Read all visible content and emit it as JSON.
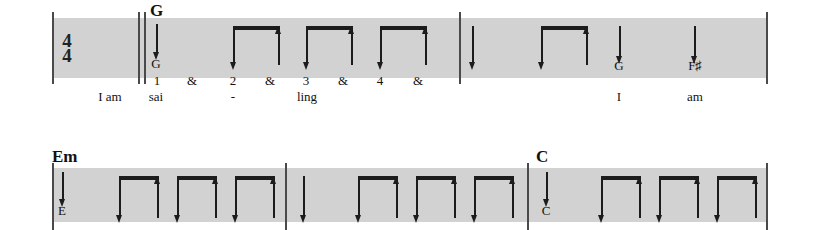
{
  "document": {
    "type": "guitar-strumming-notation",
    "time_signature": {
      "numerator": "4",
      "denominator": "4"
    }
  },
  "colors": {
    "staff_band": "#d2d2d2",
    "ink": "#1c1c1c",
    "barline": "#4a4a4a",
    "page": "#ffffff"
  },
  "systems": [
    {
      "name": "system-1",
      "measures": [
        {
          "name": "measure-1",
          "chord": "G",
          "counts": [
            "1",
            "&",
            "2",
            "&",
            "3",
            "&",
            "4",
            "&"
          ],
          "lyrics": [
            "sai",
            "-",
            "ling"
          ],
          "bass_notes": [
            "G"
          ],
          "strums": [
            "down",
            "down-up",
            "down-up",
            "down-up"
          ]
        },
        {
          "name": "measure-2",
          "chord": "",
          "counts": [],
          "lyrics": [
            "I",
            "am"
          ],
          "bass_notes": [
            "G",
            "F♯"
          ],
          "strums": [
            "down",
            "down-up",
            "down",
            "down"
          ]
        }
      ],
      "pickup_lyric": "I am"
    },
    {
      "name": "system-2",
      "measures": [
        {
          "name": "measure-3",
          "chord": "Em",
          "counts": [],
          "lyrics": [],
          "bass_notes": [
            "E"
          ],
          "strums": [
            "down",
            "down-up",
            "down-up",
            "down-up"
          ]
        },
        {
          "name": "measure-4",
          "chord": "",
          "counts": [],
          "lyrics": [],
          "bass_notes": [],
          "strums": [
            "down",
            "down-up",
            "down-up",
            "down-up"
          ]
        },
        {
          "name": "measure-5",
          "chord": "C",
          "counts": [],
          "lyrics": [],
          "bass_notes": [
            "C"
          ],
          "strums": [
            "down",
            "down-up",
            "down-up",
            "down-up"
          ]
        }
      ],
      "pickup_lyric": ""
    }
  ],
  "labels": {
    "time_numerator": "4",
    "time_denominator": "4",
    "chord_g": "G",
    "chord_em": "Em",
    "chord_c": "C",
    "bass_g": "G",
    "bass_fsharp": "F♯",
    "bass_e": "E",
    "bass_c": "C",
    "count_1": "1",
    "count_2": "2",
    "count_3": "3",
    "count_4": "4",
    "and_1": "&",
    "and_2": "&",
    "and_3": "&",
    "and_4": "&",
    "lyric_pickup": "I am",
    "lyric_sai": "sai",
    "lyric_dash": "-",
    "lyric_ling": "ling",
    "lyric_i": "I",
    "lyric_am": "am"
  }
}
